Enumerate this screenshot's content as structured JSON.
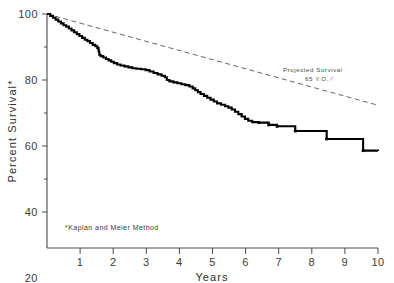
{
  "chart_data": {
    "type": "line",
    "title": "",
    "xlabel": "Years",
    "ylabel": "Percent Survival*",
    "xlim": [
      0,
      10
    ],
    "ylim": [
      0,
      100
    ],
    "grid": false,
    "legend_position": "inline-annotation",
    "xticks": [
      "1",
      "2",
      "3",
      "4",
      "5",
      "6",
      "7",
      "8",
      "9",
      "10"
    ],
    "xtick_values": [
      1,
      2,
      3,
      4,
      5,
      6,
      7,
      8,
      9,
      10
    ],
    "yticks": [
      "20",
      "40",
      "60",
      "80",
      "100"
    ],
    "ytick_values": [
      20,
      40,
      60,
      80,
      100
    ],
    "annotations": [
      {
        "name": "projected-survival-label",
        "line1": "Projected Survival",
        "line2": "65 Y.O.♂",
        "x": 7.1,
        "y": 76
      },
      {
        "name": "method-footnote",
        "text": "*Kaplan and Meier Method",
        "x": 0.55,
        "y": 14
      }
    ],
    "series": [
      {
        "name": "Observed Survival (Kaplan-Meier)",
        "style": "step",
        "color": "#000000",
        "points": [
          [
            0.0,
            100.0
          ],
          [
            0.1,
            99.2
          ],
          [
            0.18,
            98.4
          ],
          [
            0.26,
            97.6
          ],
          [
            0.34,
            96.8
          ],
          [
            0.42,
            96.0
          ],
          [
            0.5,
            95.2
          ],
          [
            0.58,
            94.6
          ],
          [
            0.66,
            93.8
          ],
          [
            0.74,
            93.0
          ],
          [
            0.82,
            92.2
          ],
          [
            0.9,
            91.4
          ],
          [
            0.98,
            90.6
          ],
          [
            1.06,
            89.8
          ],
          [
            1.14,
            89.0
          ],
          [
            1.22,
            88.4
          ],
          [
            1.3,
            87.6
          ],
          [
            1.38,
            86.8
          ],
          [
            1.46,
            86.2
          ],
          [
            1.52,
            85.4
          ],
          [
            1.56,
            84.0
          ],
          [
            1.58,
            82.6
          ],
          [
            1.62,
            82.0
          ],
          [
            1.7,
            81.4
          ],
          [
            1.78,
            80.8
          ],
          [
            1.86,
            80.2
          ],
          [
            1.94,
            79.6
          ],
          [
            2.02,
            79.0
          ],
          [
            2.12,
            78.4
          ],
          [
            2.22,
            78.0
          ],
          [
            2.34,
            77.6
          ],
          [
            2.46,
            77.2
          ],
          [
            2.58,
            76.8
          ],
          [
            2.7,
            76.6
          ],
          [
            2.84,
            76.4
          ],
          [
            2.98,
            76.0
          ],
          [
            3.1,
            75.4
          ],
          [
            3.22,
            74.8
          ],
          [
            3.34,
            74.2
          ],
          [
            3.46,
            73.6
          ],
          [
            3.56,
            73.0
          ],
          [
            3.62,
            71.8
          ],
          [
            3.7,
            71.2
          ],
          [
            3.82,
            70.8
          ],
          [
            3.94,
            70.4
          ],
          [
            4.06,
            70.0
          ],
          [
            4.18,
            69.6
          ],
          [
            4.3,
            69.0
          ],
          [
            4.4,
            68.2
          ],
          [
            4.48,
            67.4
          ],
          [
            4.56,
            66.6
          ],
          [
            4.64,
            65.8
          ],
          [
            4.74,
            65.0
          ],
          [
            4.84,
            64.2
          ],
          [
            4.94,
            63.4
          ],
          [
            5.04,
            62.6
          ],
          [
            5.14,
            61.8
          ],
          [
            5.26,
            61.2
          ],
          [
            5.38,
            60.6
          ],
          [
            5.48,
            60.0
          ],
          [
            5.58,
            59.2
          ],
          [
            5.68,
            58.2
          ],
          [
            5.78,
            57.2
          ],
          [
            5.88,
            56.2
          ],
          [
            5.98,
            55.2
          ],
          [
            6.08,
            54.4
          ],
          [
            6.2,
            53.8
          ],
          [
            6.4,
            53.6
          ],
          [
            6.7,
            52.6
          ],
          [
            6.95,
            52.0
          ],
          [
            7.5,
            50.0
          ],
          [
            8.45,
            46.6
          ],
          [
            9.55,
            41.6
          ],
          [
            10.0,
            41.4
          ]
        ],
        "censor_ticks": [
          [
            6.4,
            53.6
          ],
          [
            6.7,
            52.6
          ],
          [
            6.95,
            52.0
          ],
          [
            7.5,
            50.0
          ],
          [
            8.45,
            46.6
          ],
          [
            9.55,
            41.6
          ]
        ]
      },
      {
        "name": "Projected Survival 65 Y.O. male",
        "style": "dashed",
        "color": "#555555",
        "points": [
          [
            0.0,
            100.0
          ],
          [
            10.0,
            61.0
          ]
        ]
      }
    ]
  },
  "figure": {
    "name": "kaplan-meier-survival-chart"
  }
}
